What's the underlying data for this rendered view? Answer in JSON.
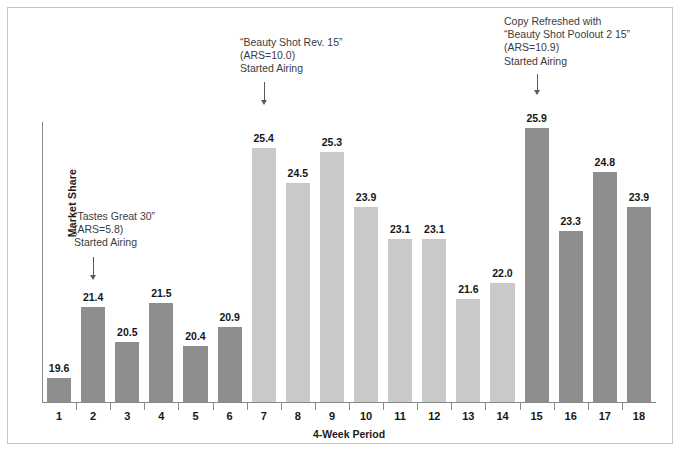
{
  "chart_data": {
    "type": "bar",
    "title": "",
    "xlabel": "4-Week Period",
    "ylabel": "Market Share",
    "categories": [
      "1",
      "2",
      "3",
      "4",
      "5",
      "6",
      "7",
      "8",
      "9",
      "10",
      "11",
      "12",
      "13",
      "14",
      "15",
      "16",
      "17",
      "18"
    ],
    "values": [
      19.6,
      21.4,
      20.5,
      21.5,
      20.4,
      20.9,
      25.4,
      24.5,
      25.3,
      23.9,
      23.1,
      23.1,
      21.6,
      22.0,
      25.9,
      23.3,
      24.8,
      23.9
    ],
    "value_labels": [
      "19.6",
      "21.4",
      "20.5",
      "21.5",
      "20.4",
      "20.9",
      "25.4",
      "24.5",
      "25.3",
      "23.9",
      "23.1",
      "23.1",
      "21.6",
      "22.0",
      "25.9",
      "23.3",
      "24.8",
      "23.9"
    ],
    "bar_colors": [
      "#8e8e8e",
      "#8e8e8e",
      "#8e8e8e",
      "#8e8e8e",
      "#8e8e8e",
      "#8e8e8e",
      "#c9c9c9",
      "#c9c9c9",
      "#c9c9c9",
      "#c9c9c9",
      "#c9c9c9",
      "#c9c9c9",
      "#c9c9c9",
      "#c9c9c9",
      "#8e8e8e",
      "#8e8e8e",
      "#8e8e8e",
      "#8e8e8e"
    ],
    "ylim": [
      19.0,
      26.6
    ],
    "grid": false,
    "legend": "none",
    "color_dark": "#8e8e8e",
    "color_light": "#c9c9c9",
    "axis_color": "#8a8a8a"
  },
  "annotations": [
    {
      "id": "tastes-great-30",
      "text": "“Tastes Great 30”\n(ARS=5.8)\nStarted Airing",
      "points_to_category": "2"
    },
    {
      "id": "beauty-shot-rev-15",
      "text": "“Beauty Shot Rev. 15”\n(ARS=10.0)\nStarted Airing",
      "points_to_category": "7"
    },
    {
      "id": "beauty-shot-poolout-2-15",
      "text": "Copy Refreshed with\n“Beauty Shot Poolout 2 15”\n(ARS=10.9)\nStarted Airing",
      "points_to_category": "15"
    }
  ]
}
